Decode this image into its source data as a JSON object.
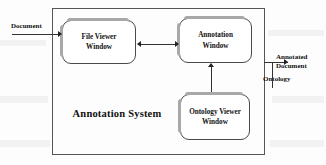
{
  "diagram": {
    "type": "block-diagram",
    "system": {
      "label": "Annotation System"
    },
    "windows": [
      {
        "id": "file-viewer",
        "label": "File Viewer\nWindow",
        "line1": "File Viewer",
        "line2": "Window"
      },
      {
        "id": "annotation",
        "label": "Annotation\nWindow",
        "line1": "Annotation",
        "line2": "Window"
      },
      {
        "id": "ontology-viewer",
        "label": "Ontology Viewer\nWindow",
        "line1": "Ontology Viewer",
        "line2": "Window"
      }
    ],
    "external_labels": {
      "input_document": "Document",
      "output_annotated_line1": "Annotated",
      "output_annotated_line2": "Document",
      "output_ontology": "Ontology"
    },
    "connectors": [
      {
        "from": "Document",
        "to": "File Viewer Window",
        "direction": "in",
        "style": "arrow"
      },
      {
        "from": "File Viewer Window",
        "to": "Annotation Window",
        "direction": "bidirectional",
        "style": "double-arrow"
      },
      {
        "from": "Ontology Viewer Window",
        "to": "Annotation Window",
        "direction": "up",
        "style": "arrow"
      },
      {
        "from": "Annotation Window",
        "to": "Annotated Document",
        "direction": "out",
        "style": "arrow"
      },
      {
        "from": "Ontology",
        "to": "Annotation Window",
        "direction": "in",
        "style": "line"
      }
    ],
    "colors": {
      "stroke": "#4a4a4a",
      "boundary": "#555555",
      "shadow": "#a8a8a8",
      "text": "#111111",
      "background": "#fdfdfd"
    }
  }
}
